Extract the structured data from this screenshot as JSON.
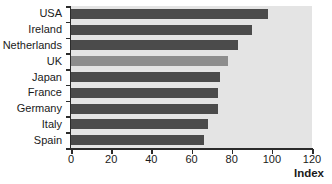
{
  "chart_data": {
    "type": "bar",
    "orientation": "horizontal",
    "title": "",
    "xlabel": "Index",
    "ylabel": "",
    "categories": [
      "USA",
      "Ireland",
      "Netherlands",
      "UK",
      "Japan",
      "France",
      "Germany",
      "Italy",
      "Spain"
    ],
    "values": [
      98,
      90,
      83,
      78,
      74,
      73,
      73,
      68,
      66
    ],
    "xlim": [
      0,
      120
    ],
    "xticks": [
      0,
      20,
      40,
      60,
      80,
      100,
      120
    ],
    "xtick_labels": [
      "0",
      "20",
      "40",
      "60",
      "80",
      "100",
      "120"
    ],
    "grid": false,
    "legend": false,
    "highlight_category": "UK",
    "bar_color": "#4b4b4b",
    "highlight_color": "#8d8d8d",
    "plot_background": "#e4e4e4",
    "axis_color": "#2b2b2b",
    "series": [
      {
        "name": "Index",
        "points": [
          {
            "category": "USA",
            "value": 98,
            "highlight": false
          },
          {
            "category": "Ireland",
            "value": 90,
            "highlight": false
          },
          {
            "category": "Netherlands",
            "value": 83,
            "highlight": false
          },
          {
            "category": "UK",
            "value": 78,
            "highlight": true
          },
          {
            "category": "Japan",
            "value": 74,
            "highlight": false
          },
          {
            "category": "France",
            "value": 73,
            "highlight": false
          },
          {
            "category": "Germany",
            "value": 73,
            "highlight": false
          },
          {
            "category": "Italy",
            "value": 68,
            "highlight": false
          },
          {
            "category": "Spain",
            "value": 66,
            "highlight": false
          }
        ]
      }
    ]
  }
}
